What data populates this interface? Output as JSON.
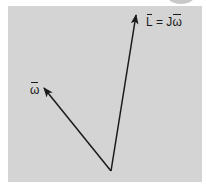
{
  "diagram": {
    "title": "",
    "labels": {
      "angular_momentum": {
        "symbol": "L",
        "equals": " = J",
        "omega": "ω",
        "full": "L̄ = Jω̄"
      },
      "angular_velocity": {
        "symbol": "ω",
        "full": "ω̄"
      }
    },
    "vectors": [
      {
        "name": "angular-momentum-vector",
        "from": [
          111,
          171
        ],
        "to": [
          136,
          14
        ],
        "label": "L̄ = Jω̄"
      },
      {
        "name": "angular-velocity-vector",
        "from": [
          111,
          171
        ],
        "to": [
          43,
          87
        ],
        "label": "ω̄"
      }
    ],
    "colors": {
      "panel": "#d4d4d4",
      "line": "#1a1a1a",
      "background": "#ffffff"
    }
  }
}
